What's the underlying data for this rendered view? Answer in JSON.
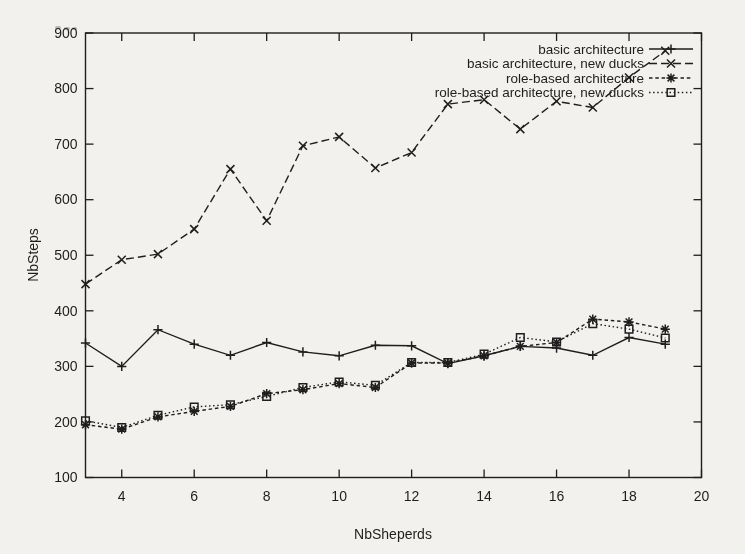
{
  "page": {
    "background": "#f2f1ee",
    "ink": "#1e1e1e"
  },
  "chart_data": {
    "type": "line",
    "title": "",
    "xlabel": "NbSheperds",
    "ylabel": "NbSteps",
    "xlim": [
      3,
      20
    ],
    "ylim": [
      100,
      900
    ],
    "xticks": [
      4,
      6,
      8,
      10,
      12,
      14,
      16,
      18,
      20
    ],
    "yticks": [
      100,
      200,
      300,
      400,
      500,
      600,
      700,
      800,
      900
    ],
    "grid": false,
    "legend_position": "top-right-inside",
    "x": [
      3,
      4,
      5,
      6,
      7,
      8,
      9,
      10,
      11,
      12,
      13,
      14,
      15,
      16,
      17,
      18,
      19
    ],
    "series": [
      {
        "name": "basic architecture",
        "line": "solid",
        "marker": "plus",
        "values": [
          342,
          300,
          366,
          340,
          320,
          343,
          326,
          319,
          338,
          337,
          305,
          319,
          336,
          333,
          320,
          352,
          340
        ]
      },
      {
        "name": "basic architecture, new ducks",
        "line": "dashed",
        "marker": "cross",
        "values": [
          448,
          492,
          502,
          547,
          655,
          562,
          697,
          713,
          657,
          685,
          772,
          780,
          727,
          777,
          766,
          820,
          868
        ]
      },
      {
        "name": "role-based architecture",
        "line": "short-dash",
        "marker": "asterisk",
        "values": [
          195,
          187,
          209,
          219,
          228,
          251,
          258,
          269,
          262,
          306,
          306,
          319,
          336,
          343,
          385,
          380,
          367
        ]
      },
      {
        "name": "role-based architecture, new ducks",
        "line": "dotted",
        "marker": "square",
        "values": [
          202,
          190,
          212,
          227,
          231,
          246,
          262,
          272,
          266,
          307,
          307,
          322,
          352,
          344,
          377,
          367,
          351
        ]
      }
    ]
  }
}
